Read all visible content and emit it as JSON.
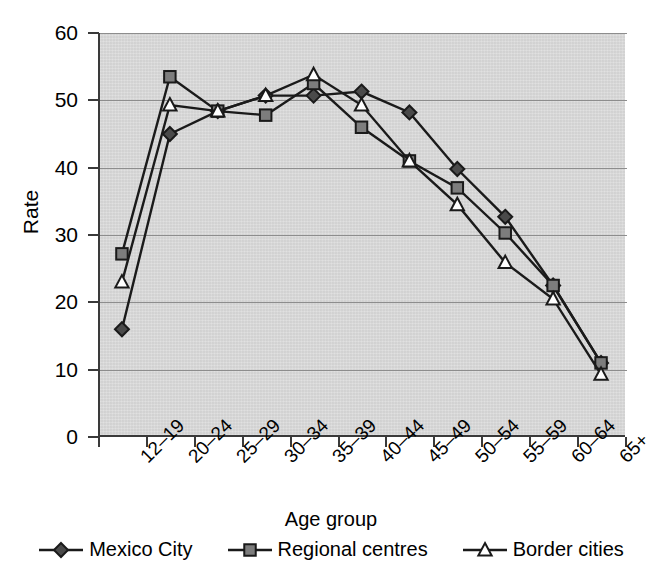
{
  "chart_data": {
    "type": "line",
    "title": "",
    "xlabel": "Age group",
    "ylabel": "Rate",
    "categories": [
      "12–19",
      "20–24",
      "25–29",
      "30–34",
      "35–39",
      "40–44",
      "45–49",
      "50–54",
      "55–59",
      "60–64",
      "65+"
    ],
    "ylim": [
      0,
      60
    ],
    "yticks": [
      0,
      10,
      20,
      30,
      40,
      50,
      60
    ],
    "ytick_labels": [
      "0",
      "10",
      "20",
      "30",
      "40",
      "50",
      "60"
    ],
    "grid": true,
    "legend_position": "bottom",
    "plot_background": "#d9d9d9",
    "series": [
      {
        "name": "Mexico City",
        "marker": "diamond",
        "marker_fill": "#4a4a4a",
        "line_color": "#1a1a1a",
        "values": [
          16.0,
          45.0,
          48.4,
          50.7,
          50.7,
          51.3,
          48.2,
          39.8,
          32.7,
          22.5,
          11.0
        ]
      },
      {
        "name": "Regional centres",
        "marker": "square",
        "marker_fill": "#7d7d7d",
        "line_color": "#1a1a1a",
        "values": [
          27.2,
          53.5,
          48.4,
          47.8,
          52.5,
          46.0,
          41.0,
          37.0,
          30.3,
          22.5,
          11.0
        ]
      },
      {
        "name": "Border cities",
        "marker": "triangle",
        "marker_fill": "#ffffff",
        "line_color": "#1a1a1a",
        "values": [
          23.0,
          49.3,
          48.4,
          50.7,
          53.8,
          49.3,
          41.0,
          34.5,
          25.9,
          20.5,
          9.3
        ]
      }
    ]
  },
  "axes": {
    "y_title": "Rate",
    "x_title": "Age group"
  },
  "legend": {
    "items": [
      {
        "label": "Mexico City",
        "marker": "diamond-marker"
      },
      {
        "label": "Regional centres",
        "marker": "square-marker"
      },
      {
        "label": "Border cities",
        "marker": "triangle-marker"
      }
    ]
  }
}
